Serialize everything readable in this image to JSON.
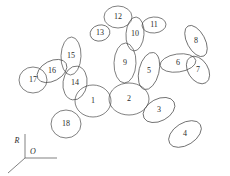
{
  "figure": {
    "type": "ellipse-skeleton-diagram",
    "width": 230,
    "height": 176,
    "background_color": "#ffffff",
    "stroke_color": "#4a4a4a",
    "label_color": "#2b2b2b"
  },
  "nodes": [
    {
      "id": 1,
      "label": "1",
      "cx": 93,
      "cy": 101,
      "rx": 18,
      "ry": 16,
      "angle": 0
    },
    {
      "id": 2,
      "label": "2",
      "cx": 129,
      "cy": 99,
      "rx": 20,
      "ry": 16,
      "angle": 0
    },
    {
      "id": 3,
      "label": "3",
      "cx": 159,
      "cy": 110,
      "rx": 17,
      "ry": 11,
      "angle": -28
    },
    {
      "id": 4,
      "label": "4",
      "cx": 185,
      "cy": 134,
      "rx": 18,
      "ry": 11,
      "angle": -32
    },
    {
      "id": 5,
      "label": "5",
      "cx": 149,
      "cy": 71,
      "rx": 10,
      "ry": 19,
      "angle": 14
    },
    {
      "id": 6,
      "label": "6",
      "cx": 178,
      "cy": 63,
      "rx": 18,
      "ry": 9,
      "angle": -8
    },
    {
      "id": 7,
      "label": "7",
      "cx": 198,
      "cy": 70,
      "rx": 10,
      "ry": 15,
      "angle": -32
    },
    {
      "id": 8,
      "label": "8",
      "cx": 196,
      "cy": 41,
      "rx": 9,
      "ry": 17,
      "angle": -28
    },
    {
      "id": 9,
      "label": "9",
      "cx": 125,
      "cy": 63,
      "rx": 11,
      "ry": 20,
      "angle": 2
    },
    {
      "id": 10,
      "label": "10",
      "cx": 135,
      "cy": 34,
      "rx": 9,
      "ry": 17,
      "angle": 4
    },
    {
      "id": 11,
      "label": "11",
      "cx": 154,
      "cy": 25,
      "rx": 12,
      "ry": 8,
      "angle": -4
    },
    {
      "id": 12,
      "label": "12",
      "cx": 118,
      "cy": 17,
      "rx": 14,
      "ry": 11,
      "angle": 0
    },
    {
      "id": 13,
      "label": "13",
      "cx": 100,
      "cy": 33,
      "rx": 10,
      "ry": 8,
      "angle": -14
    },
    {
      "id": 14,
      "label": "14",
      "cx": 75,
      "cy": 83,
      "rx": 12,
      "ry": 17,
      "angle": 8
    },
    {
      "id": 15,
      "label": "15",
      "cx": 71,
      "cy": 56,
      "rx": 10,
      "ry": 19,
      "angle": 2
    },
    {
      "id": 16,
      "label": "16",
      "cx": 52,
      "cy": 71,
      "rx": 16,
      "ry": 10,
      "angle": -28
    },
    {
      "id": 17,
      "label": "17",
      "cx": 33,
      "cy": 80,
      "rx": 14,
      "ry": 13,
      "angle": 0
    },
    {
      "id": 18,
      "label": "18",
      "cx": 66,
      "cy": 124,
      "rx": 15,
      "ry": 14,
      "angle": 0
    }
  ],
  "axis_indicator": {
    "name": "coordinate-frame",
    "origin_label": "O",
    "vertical_label": "R",
    "origin": {
      "x": 25,
      "y": 158
    },
    "vertical_end": {
      "x": 25,
      "y": 134
    },
    "horizontal_end": {
      "x": 57,
      "y": 158
    },
    "diagonal_end": {
      "x": 8,
      "y": 173
    },
    "vertical_label_pos": {
      "x": 17,
      "y": 141
    },
    "origin_label_pos": {
      "x": 33,
      "y": 152
    }
  }
}
